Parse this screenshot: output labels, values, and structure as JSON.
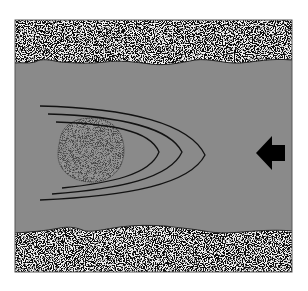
{
  "diagram": {
    "colors": {
      "background": "#ffffff",
      "frame": "#555555",
      "channel": "#8a8a8a",
      "particle": "#7a7a7a",
      "lines": "#111111",
      "arrow": "#000000"
    },
    "elements": {
      "top_wall": {
        "kind": "granular-texture-band"
      },
      "bottom_wall": {
        "kind": "granular-texture-band"
      },
      "channel": {
        "kind": "gray-fill"
      },
      "particle": {
        "kind": "stippled-oval"
      },
      "flow_lines": {
        "count": 3,
        "shape": "U-curve opening left"
      },
      "flow_arrow": {
        "direction": "left"
      }
    }
  }
}
